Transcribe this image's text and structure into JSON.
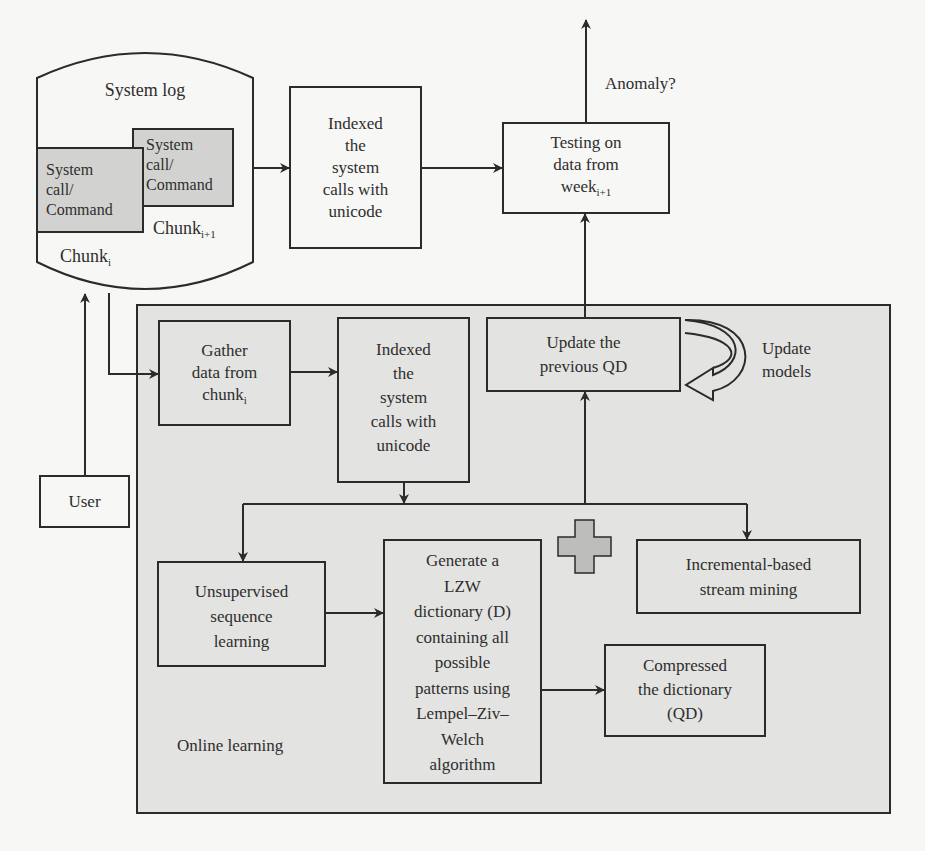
{
  "diagram": {
    "colors": {
      "background": "#f7f7f5",
      "panel_fill": "#e3e3e1",
      "box_fill_gray": "#d2d2d0",
      "stroke": "#2b2b2b",
      "plus_fill": "#bdbdbb"
    },
    "system_log": {
      "title": "System log",
      "chunk_i": {
        "text": "System call/ Command",
        "line1": "System",
        "line2": "call/",
        "line3": "Command",
        "label": "Chunk",
        "subscript": "i"
      },
      "chunk_i1": {
        "text": "System call/ Command",
        "line1": "System",
        "line2": "call/",
        "line3": "Command",
        "label": "Chunk",
        "subscript": "i+1"
      }
    },
    "top_indexed": {
      "lines": [
        "Indexed",
        "the",
        "system",
        "calls with",
        "unicode"
      ]
    },
    "testing": {
      "lines": [
        "Testing on",
        "data from",
        "week"
      ],
      "subscript": "i+1"
    },
    "anomaly_label": "Anomaly?",
    "user": {
      "label": "User"
    },
    "online_learning": {
      "label": "Online learning",
      "gather": {
        "lines": [
          "Gather",
          "data from",
          "chunk"
        ],
        "subscript": "i"
      },
      "indexed": {
        "lines": [
          "Indexed",
          "the",
          "system",
          "calls with",
          "unicode"
        ]
      },
      "update_qd": {
        "lines": [
          "Update the",
          "previous QD"
        ]
      },
      "update_models": {
        "lines": [
          "Update",
          "models"
        ]
      },
      "unsupervised": {
        "lines": [
          "Unsupervised",
          "sequence",
          "learning"
        ]
      },
      "lzw": {
        "lines": [
          "Generate a",
          "LZW",
          "dictionary (D)",
          "containing all",
          "possible",
          "patterns using",
          "Lempel–Ziv–",
          "Welch",
          "algorithm"
        ]
      },
      "incremental": {
        "lines": [
          "Incremental-based",
          "stream mining"
        ]
      },
      "compressed": {
        "lines": [
          "Compressed",
          "the dictionary",
          "(QD)"
        ]
      },
      "plus_icon": "plus"
    }
  }
}
